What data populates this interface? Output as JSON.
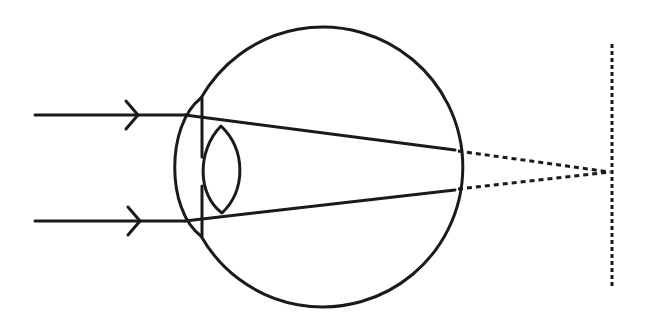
{
  "diagram": {
    "colors": {
      "line": "#1a1a1a",
      "background": "#ffffff"
    },
    "eyeball": {
      "cx": 318,
      "cy": 166,
      "r": 140
    },
    "rays": [
      {
        "start": [
          35,
          115
        ],
        "cornea": [
          185,
          115
        ],
        "retina": [
          455,
          150
        ]
      },
      {
        "start": [
          35,
          221
        ],
        "cornea": [
          185,
          221
        ],
        "retina": [
          455,
          190
        ]
      }
    ],
    "focal_point": [
      612,
      172
    ],
    "image_plane_x": 612
  }
}
